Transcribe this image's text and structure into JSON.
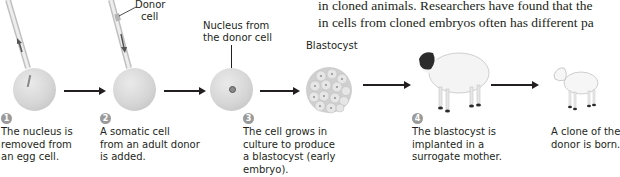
{
  "body_text": {
    "line1": "in cloned animals. Researchers have found that the",
    "line2": "in cells from cloned embryos often has different pa"
  },
  "labels": {
    "donor_cell": "Donor\ncell",
    "donor_cell_line1": "Donor",
    "donor_cell_line2": "cell",
    "nucleus_line1": "Nucleus from",
    "nucleus_line2": "the donor cell",
    "blastocyst": "Blastocyst"
  },
  "steps": [
    {
      "number": "1",
      "lines": [
        "The nucleus is",
        "removed from",
        "an egg cell."
      ]
    },
    {
      "number": "2",
      "lines": [
        "A somatic cell",
        "from an adult donor",
        "is added."
      ]
    },
    {
      "number": "3",
      "lines": [
        "The cell grows in",
        "culture to produce",
        "a blastocyst (early",
        "embryo)."
      ]
    },
    {
      "number": "4",
      "lines": [
        "The blastocyst is",
        "implanted in a",
        "surrogate mother."
      ]
    },
    {
      "number": "",
      "lines": [
        "A clone of the",
        "donor is born."
      ]
    }
  ],
  "colors": {
    "text": "#231f20",
    "cell": "#d6d6d6",
    "step_badge": "#9a9a9a",
    "sheep_face": "#2b2b2b",
    "wool": "#f4f4f4"
  }
}
